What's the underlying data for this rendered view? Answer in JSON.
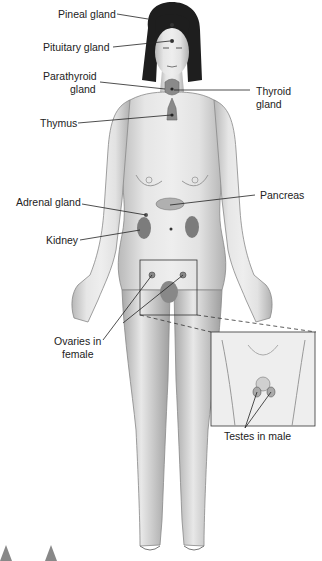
{
  "figure": {
    "labels": {
      "pineal": "Pineal gland",
      "pituitary": "Pituitary gland",
      "parathyroid_1": "Parathyroid",
      "parathyroid_2": "gland",
      "thyroid_1": "Thyroid",
      "thyroid_2": "gland",
      "thymus": "Thymus",
      "adrenal": "Adrenal gland",
      "pancreas": "Pancreas",
      "kidney": "Kidney",
      "ovaries_1": "Ovaries in",
      "ovaries_2": "female",
      "testes": "Testes in male"
    },
    "colors": {
      "skin": "#dcdcdc",
      "skin_shadow": "#a9a9a9",
      "hair": "#1e1e1e",
      "gland": "#8a8a8a",
      "leader": "#222222"
    }
  }
}
